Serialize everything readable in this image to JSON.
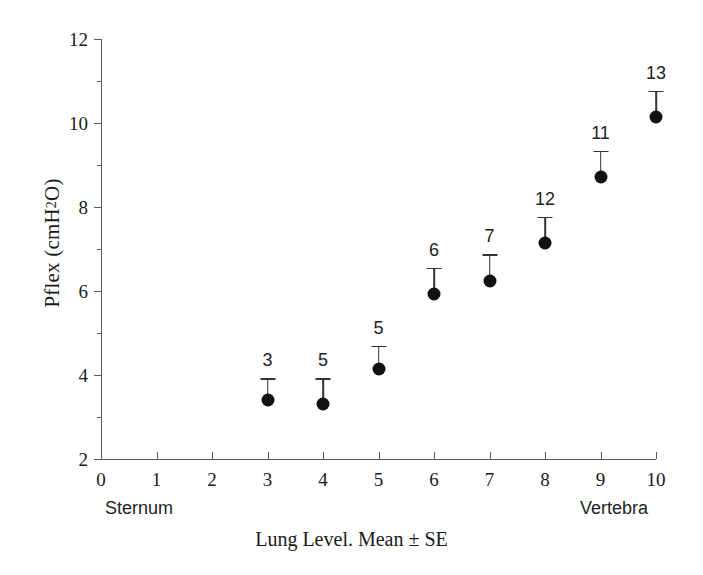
{
  "chart_data": {
    "type": "scatter",
    "title": "",
    "xlabel": "Lung Level. Mean ± SE",
    "ylabel_text": "Pflex (cmH",
    "ylabel_sub": "2",
    "ylabel_tail": "O)",
    "ylabel_full": "Pflex (cmH2O)",
    "xlim": [
      0,
      10
    ],
    "ylim": [
      2,
      12
    ],
    "grid": false,
    "legend": null,
    "x_major_ticks": [
      0,
      1,
      2,
      3,
      4,
      5,
      6,
      7,
      8,
      9,
      10
    ],
    "x_tick_labels": [
      "0",
      "1",
      "2",
      "3",
      "4",
      "5",
      "6",
      "7",
      "8",
      "9",
      "10"
    ],
    "y_major_ticks": [
      2,
      4,
      6,
      8,
      10,
      12
    ],
    "y_tick_labels": [
      "2",
      "4",
      "6",
      "8",
      "10",
      "12"
    ],
    "y_minor_ticks": [
      3,
      5,
      7,
      9,
      11
    ],
    "x": [
      3,
      4,
      5,
      6,
      7,
      8,
      9,
      10
    ],
    "values": [
      3.4,
      3.3,
      4.15,
      5.93,
      6.25,
      7.15,
      8.72,
      10.15
    ],
    "errors_upper": [
      0.52,
      0.62,
      0.55,
      0.62,
      0.62,
      0.62,
      0.62,
      0.62
    ],
    "point_labels": [
      "3",
      "5",
      "5",
      "6",
      "7",
      "12",
      "11",
      "13"
    ],
    "point_label_meaning": "n",
    "annotations": {
      "left_axis_end": "Sternum",
      "right_axis_end": "Vertebra"
    },
    "marker": "filled-circle",
    "marker_color": "#111111",
    "errorbar_color": "#333333",
    "axis_color": "#555a5e"
  },
  "axis_label_left": "Sternum",
  "axis_label_right": "Vertebra"
}
